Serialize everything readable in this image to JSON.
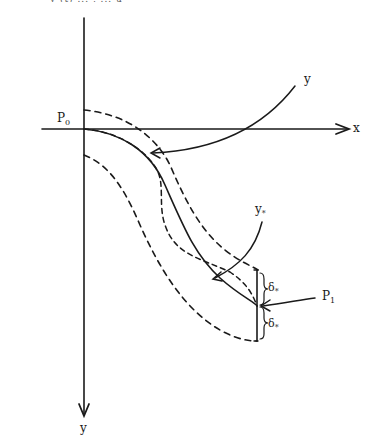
{
  "diagram": {
    "top_caption_fragment": "y (t) ... ,   ... u",
    "axes": {
      "x_label": "x",
      "y_label": "y"
    },
    "points": {
      "p0": {
        "base": "P",
        "sub": "0"
      },
      "p1": {
        "base": "P",
        "sub": "1"
      }
    },
    "curve_labels": {
      "y": "y",
      "y_star": {
        "base": "y",
        "sub": "*"
      }
    },
    "tube_width": {
      "upper": {
        "base": "δ",
        "sub": "*"
      },
      "lower": {
        "base": "δ",
        "sub": "*"
      }
    },
    "colors": {
      "stroke": "#1a1a1a",
      "background": "#ffffff"
    }
  }
}
